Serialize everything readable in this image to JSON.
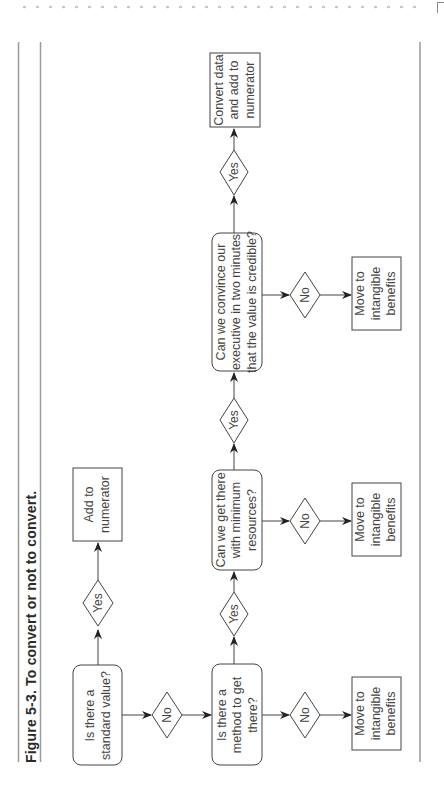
{
  "figure": {
    "title": "Figure 5-3. To convert or not to convert."
  },
  "nodes": {
    "q_standard": {
      "lines": [
        "Is there a",
        "standard value?"
      ]
    },
    "q_method": {
      "lines": [
        "Is there a",
        "method to get",
        "there?"
      ]
    },
    "q_resources": {
      "lines": [
        "Can we get there",
        "with minimum",
        "resources?"
      ]
    },
    "q_convince": {
      "lines": [
        "Can we convince our",
        "executive in two minutes",
        "that the value is credible?"
      ]
    },
    "out_add_numerator": {
      "lines": [
        "Add to",
        "numerator"
      ]
    },
    "out_convert": {
      "lines": [
        "Convert data",
        "and add to",
        "numerator"
      ]
    },
    "out_intangible_1": {
      "lines": [
        "Move to",
        "intangible",
        "benefits"
      ]
    },
    "out_intangible_2": {
      "lines": [
        "Move to",
        "intangible",
        "benefits"
      ]
    },
    "out_intangible_3": {
      "lines": [
        "Move to",
        "intangible",
        "benefits"
      ]
    }
  },
  "decisions": {
    "yes_label": "Yes",
    "no_label": "No"
  },
  "colors": {
    "stroke": "#444444",
    "frame": "#9a9a9a",
    "text": "#444444"
  }
}
